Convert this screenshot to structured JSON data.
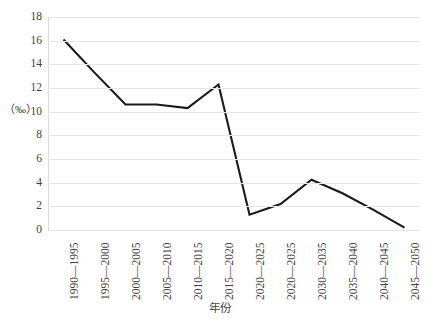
{
  "chart_data": {
    "type": "line",
    "title": "",
    "xlabel": "年份",
    "ylabel": "（‰）",
    "categories": [
      "1990—1995",
      "1995—2000",
      "2000—2005",
      "2005—2010",
      "2010—2015",
      "2015—2020",
      "2020—2025",
      "2020—2025",
      "2030—2035",
      "2035—2040",
      "2040—2045",
      "2045—2050"
    ],
    "values": [
      16.1,
      13.3,
      10.6,
      10.6,
      10.3,
      12.3,
      1.3,
      2.2,
      4.25,
      3.1,
      1.7,
      0.2
    ],
    "ylim": [
      0,
      18
    ],
    "ytick_step": 2,
    "yticks": [
      18,
      16,
      14,
      12,
      10,
      8,
      6,
      4,
      2,
      0
    ],
    "grid": true,
    "legend": false,
    "series_color": "#1a1a1a",
    "grid_color": "#e6e6e6",
    "text_color": "#3f3f3f",
    "background": "#ffffff"
  }
}
